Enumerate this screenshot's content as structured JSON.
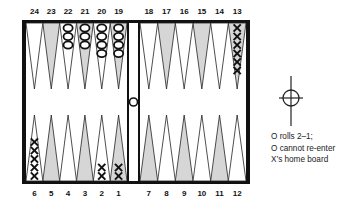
{
  "diagram": {
    "top_labels": [
      "24",
      "23",
      "22",
      "21",
      "20",
      "19",
      "18",
      "17",
      "16",
      "15",
      "14",
      "13"
    ],
    "bottom_labels": [
      "1",
      "2",
      "3",
      "4",
      "5",
      "6",
      "7",
      "8",
      "9",
      "10",
      "11",
      "12"
    ],
    "colors": {
      "frame": "#111111",
      "dark_point": "#d6d6d6",
      "light_point": "#ffffff",
      "checker_x": "#111111",
      "checker_o": "#111111"
    },
    "checkers": [
      {
        "point": 1,
        "player": "X",
        "count": 2
      },
      {
        "point": 2,
        "player": "X",
        "count": 2
      },
      {
        "point": 6,
        "player": "X",
        "count": 5
      },
      {
        "point": 13,
        "player": "X",
        "count": 6
      },
      {
        "point": 19,
        "player": "O",
        "count": 4
      },
      {
        "point": 20,
        "player": "O",
        "count": 4
      },
      {
        "point": 21,
        "player": "O",
        "count": 3
      },
      {
        "point": 22,
        "player": "O",
        "count": 3
      },
      {
        "point": "bar",
        "player": "O",
        "count": 1
      }
    ],
    "icon": "crosshair-target-icon"
  },
  "caption": {
    "line1": "O rolls 2–1;",
    "line2": "O cannot re-enter",
    "line3": "X’s home board"
  }
}
